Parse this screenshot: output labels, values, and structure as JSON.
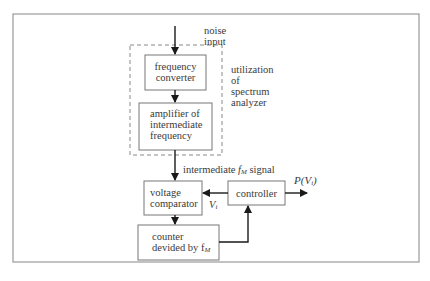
{
  "diagram": {
    "input_label": [
      "noise",
      "input"
    ],
    "group_label": [
      "utilization",
      "of",
      "spectrum",
      "analyzer"
    ],
    "blocks": {
      "frequency_converter": [
        "frequency",
        "converter"
      ],
      "if_amplifier": [
        "amplifier of",
        "intermediate",
        "frequency"
      ],
      "voltage_comparator": [
        "voltage",
        "comparator"
      ],
      "controller": "controller",
      "counter": [
        "counter",
        "devided by f"
      ]
    },
    "counter_subscript": "M",
    "signal_label": {
      "prefix": "intermediate ",
      "var": "f",
      "sub": "M",
      "suffix": " signal"
    },
    "vi_label": {
      "var": "V",
      "sub": "i"
    },
    "output_label": {
      "prefix": "P(",
      "var": "V",
      "sub": "i",
      "suffix": ")"
    },
    "colors": {
      "line": "#1a1a1a",
      "box": "#777777",
      "frame": "#999999",
      "dash": "#888888"
    }
  }
}
